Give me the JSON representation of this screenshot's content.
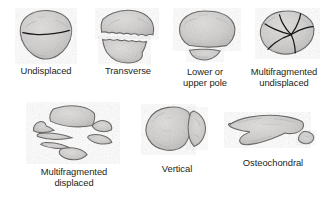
{
  "figure": {
    "background_color": "#ffffff",
    "bone_fill_color": "#d4d3d2",
    "bone_outline_color": "#6f6d6c",
    "fracture_line_color": "#1a1a1a",
    "label_color": "#231f20"
  },
  "panels": [
    {
      "id": "undisplaced",
      "label": "Undisplaced",
      "view": "anterior",
      "fragment_count": 2,
      "displaced": false,
      "fracture_pattern": "single horizontal transverse line, no separation"
    },
    {
      "id": "transverse",
      "label": "Transverse",
      "view": "anterior",
      "fragment_count": 2,
      "displaced": true,
      "fracture_pattern": "horizontal split with gap between upper and lower halves"
    },
    {
      "id": "pole",
      "label": "Lower or\nupper pole",
      "view": "anterior",
      "fragment_count": 2,
      "displaced": true,
      "fracture_pattern": "large main body with small separated pole fragment below"
    },
    {
      "id": "multi-undisplaced",
      "label": "Multifragmented\nundisplaced",
      "view": "anterior",
      "fragment_count": 5,
      "displaced": false,
      "fracture_pattern": "multiple radiating fracture lines converging, fragments in place"
    },
    {
      "id": "multi-displaced",
      "label": "Multifragmented\ndisplaced",
      "view": "anterior",
      "fragment_count": 7,
      "displaced": true,
      "fracture_pattern": "many scattered separated bone fragments"
    },
    {
      "id": "vertical",
      "label": "Vertical",
      "view": "anterior",
      "fragment_count": 2,
      "displaced": true,
      "fracture_pattern": "vertical split, narrow lateral crescent fragment separated"
    },
    {
      "id": "osteochondral",
      "label": "Osteochondral",
      "view": "lateral",
      "fragment_count": 2,
      "displaced": true,
      "fracture_pattern": "profile view with small osteochondral flake detached at posterior margin"
    }
  ]
}
